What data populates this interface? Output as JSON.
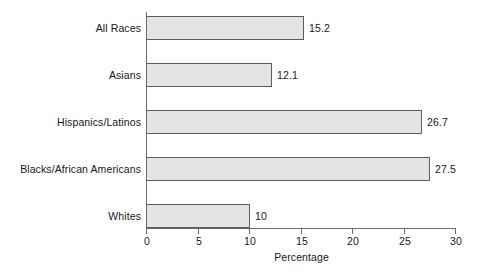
{
  "chart_data": {
    "type": "bar",
    "orientation": "horizontal",
    "title": "",
    "xlabel": "Percentage",
    "ylabel": "",
    "xlim": [
      0,
      30
    ],
    "xticks": [
      0,
      5,
      10,
      15,
      20,
      25,
      30
    ],
    "xtick_labels": [
      "0",
      "5",
      "10",
      "15",
      "20",
      "25",
      "30"
    ],
    "grid": false,
    "legend": false,
    "bar_fill_color": "#e4e4e4",
    "bar_border_color": "#5d5d5d",
    "axis_color": "#6a6a6a",
    "categories": [
      "All Races",
      "Asians",
      "Hispanics/Latinos",
      "Blacks/African Americans",
      "Whites"
    ],
    "values": [
      15.2,
      12.1,
      26.7,
      27.5,
      10
    ],
    "value_labels": [
      "15.2",
      "12.1",
      "26.7",
      "27.5",
      "10"
    ],
    "bars": [
      {
        "category": "All Races",
        "value": 15.2,
        "label": "15.2"
      },
      {
        "category": "Asians",
        "value": 12.1,
        "label": "12.1"
      },
      {
        "category": "Hispanics/Latinos",
        "value": 26.7,
        "label": "26.7"
      },
      {
        "category": "Blacks/African Americans",
        "value": 27.5,
        "label": "27.5"
      },
      {
        "category": "Whites",
        "value": 10,
        "label": "10"
      }
    ]
  }
}
